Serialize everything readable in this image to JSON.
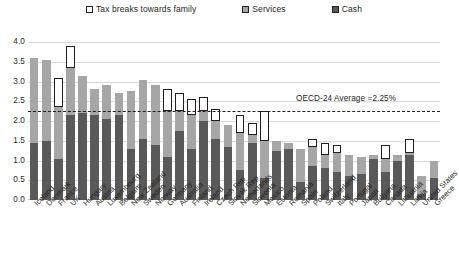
{
  "legend": {
    "items": [
      {
        "label": "Tax breaks towards family",
        "icon": "square-outline-swatch",
        "color": "#ffffff"
      },
      {
        "label": "Services",
        "icon": "square-swatch",
        "color": "#a6a6a6"
      },
      {
        "label": "Cash",
        "icon": "square-swatch",
        "color": "#595959"
      }
    ]
  },
  "annotation": {
    "average_label": "OECD-24 Average =2.25%",
    "average_value": 2.25
  },
  "chart_data": {
    "type": "bar",
    "stacked": true,
    "title": "",
    "subtitle": "",
    "xlabel": "",
    "ylabel": "",
    "ylim": [
      0.0,
      4.0
    ],
    "yticks": [
      "0.0",
      "0.5",
      "1.0",
      "1.5",
      "2.0",
      "2.5",
      "3.0",
      "3.5",
      "4.0"
    ],
    "ytick_values": [
      0.0,
      0.5,
      1.0,
      1.5,
      2.0,
      2.5,
      3.0,
      3.5,
      4.0
    ],
    "grid": true,
    "legend_position": "top-center",
    "annotations": [
      {
        "text": "OECD-24 Average =2.25%",
        "type": "hline",
        "value": 2.25,
        "style": "dash-dot"
      }
    ],
    "categories": [
      "Iceland",
      "Denmark",
      "France",
      "UK",
      "Hungary",
      "Austria",
      "Luxembourg",
      "Belgium",
      "New Zealand",
      "Sweden",
      "Norway",
      "Germany",
      "Australia",
      "Finland",
      "Ireland",
      "Czech Rep",
      "Slovak Rep",
      "Netherlands",
      "Slovenia",
      "Mexico",
      "Estonia",
      "Romania",
      "Spain",
      "Poland",
      "Switzerland",
      "Italy",
      "Portugal",
      "Japan",
      "Bulgaria",
      "Canada",
      "Lithuania",
      "Latvia",
      "United States",
      "Greece"
    ],
    "series": [
      {
        "name": "Cash",
        "color": "#595959",
        "values": [
          1.45,
          1.5,
          1.05,
          2.15,
          2.2,
          2.15,
          2.05,
          2.15,
          1.3,
          1.55,
          1.4,
          1.1,
          1.75,
          1.3,
          2.0,
          1.55,
          1.35,
          0.75,
          1.45,
          0.55,
          1.25,
          1.3,
          0.45,
          0.85,
          0.8,
          0.7,
          0.6,
          0.65,
          1.05,
          0.7,
          1.0,
          1.15,
          0.15,
          0.55
        ]
      },
      {
        "name": "Services",
        "color": "#a6a6a6",
        "values": [
          2.15,
          2.05,
          1.3,
          1.2,
          0.95,
          0.65,
          0.85,
          0.55,
          1.45,
          1.5,
          1.5,
          1.15,
          0.5,
          0.85,
          0.25,
          0.45,
          0.55,
          0.95,
          0.2,
          0.95,
          0.25,
          0.15,
          0.85,
          0.5,
          0.35,
          0.5,
          0.55,
          0.45,
          0.1,
          0.35,
          0.15,
          0.05,
          0.45,
          0.45
        ]
      },
      {
        "name": "Tax breaks towards family",
        "color": "#ffffff",
        "values": [
          0.0,
          0.0,
          0.75,
          0.55,
          0.0,
          0.0,
          0.0,
          0.0,
          0.0,
          0.0,
          0.0,
          0.55,
          0.45,
          0.4,
          0.35,
          0.3,
          0.0,
          0.45,
          0.3,
          0.75,
          0.0,
          0.0,
          0.0,
          0.2,
          0.3,
          0.2,
          0.0,
          0.0,
          0.0,
          0.35,
          0.0,
          0.35,
          0.0,
          0.0
        ]
      }
    ]
  }
}
